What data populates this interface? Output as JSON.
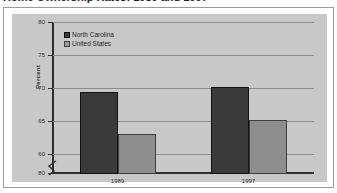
{
  "title": "Home Ownership Rates: 1989 and 1997",
  "panel": {
    "ylabel": "Percent"
  },
  "legend": {
    "items": [
      {
        "label": "North Carolina",
        "color": "#3a3a3a",
        "swatch": "legend-swatch-north-carolina"
      },
      {
        "label": "United States",
        "color": "#9a9a9a",
        "swatch": "legend-swatch-united-states"
      }
    ]
  },
  "axis": {
    "yticks": [
      "80",
      "75",
      "70",
      "65",
      "60",
      "0"
    ],
    "break_marker": "axis-break-zigzag"
  },
  "chart_data": {
    "type": "bar",
    "title": "Home Ownership Rates: 1989 and 1997",
    "xlabel": "",
    "ylabel": "Percent",
    "categories": [
      "1989",
      "1997"
    ],
    "series": [
      {
        "name": "North Carolina",
        "values": [
          69.4,
          70.2
        ],
        "color": "#3a3a3a"
      },
      {
        "name": "United States",
        "values": [
          63.1,
          65.2
        ],
        "color": "#8e8e8e"
      }
    ],
    "ylim": [
      60,
      80
    ],
    "yticks": [
      60,
      65,
      70,
      75,
      80
    ],
    "axis_break": true,
    "axis_break_below": 60,
    "grid": true,
    "legend_position": "top-left"
  }
}
